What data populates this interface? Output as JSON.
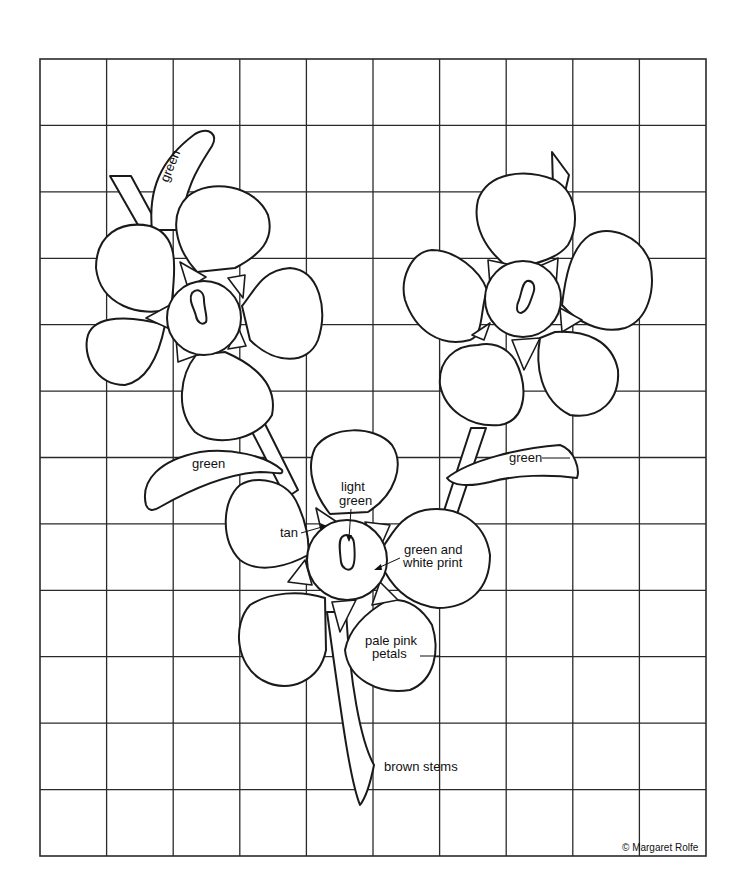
{
  "diagram": {
    "type": "applique-pattern-grid",
    "grid": {
      "columns": 10,
      "rows": 12,
      "left": 40,
      "top": 59,
      "right": 706,
      "bottom": 856
    },
    "labels": {
      "top_leaf": "green",
      "left_leaf": "green",
      "right_leaf": "green",
      "center_line1": "light",
      "center_line2": "green",
      "tan": "tan",
      "print_line1": "green and",
      "print_line2": "white print",
      "petals_line1": "pale pink",
      "petals_line2": "petals",
      "stems": "brown stems"
    },
    "copyright": "© Margaret Rolfe",
    "flowers": [
      "upper-left-flower",
      "upper-right-flower",
      "lower-center-flower"
    ],
    "colors": {
      "line": "#1a1a1a",
      "background": "#ffffff"
    }
  }
}
